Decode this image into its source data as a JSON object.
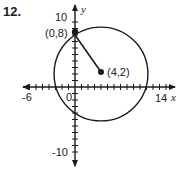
{
  "problem_number": "12.",
  "graph": {
    "x_axis_label": "x",
    "y_axis_label": "y",
    "x_tick_labels": [
      "-6",
      "0",
      "14"
    ],
    "y_tick_labels": [
      "10",
      "-10"
    ],
    "x_range": [
      -6,
      14
    ],
    "y_range": [
      -10,
      10
    ],
    "tick_interval": 1
  },
  "circle": {
    "center": [
      4,
      2
    ],
    "center_label": "(4,2)",
    "point_on_circle": [
      0,
      8
    ],
    "point_label": "(0,8)",
    "radius_segment": "from (0,8) to (4,2)"
  },
  "colors": {
    "ink": "#1a1a1a",
    "background": "#ffffff"
  }
}
